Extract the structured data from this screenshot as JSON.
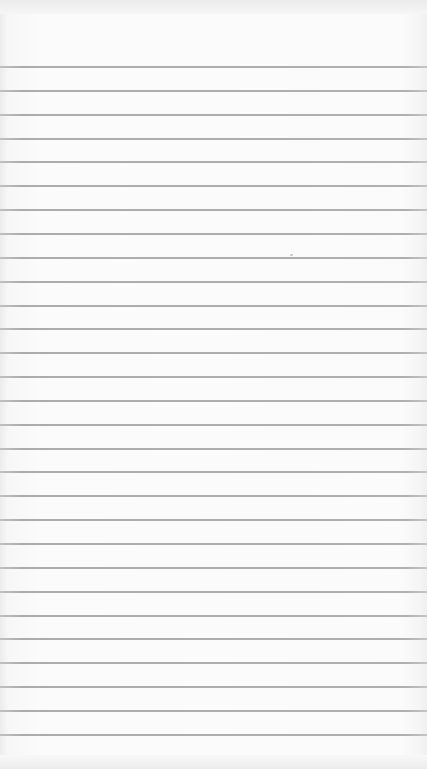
{
  "scene": {
    "subject": "ruled notebook paper",
    "paper_color": "#fbfbfb",
    "rule_color": "#a0a0a0",
    "rule_count": 29,
    "first_rule_y": 66,
    "rule_spacing": 23.85
  }
}
